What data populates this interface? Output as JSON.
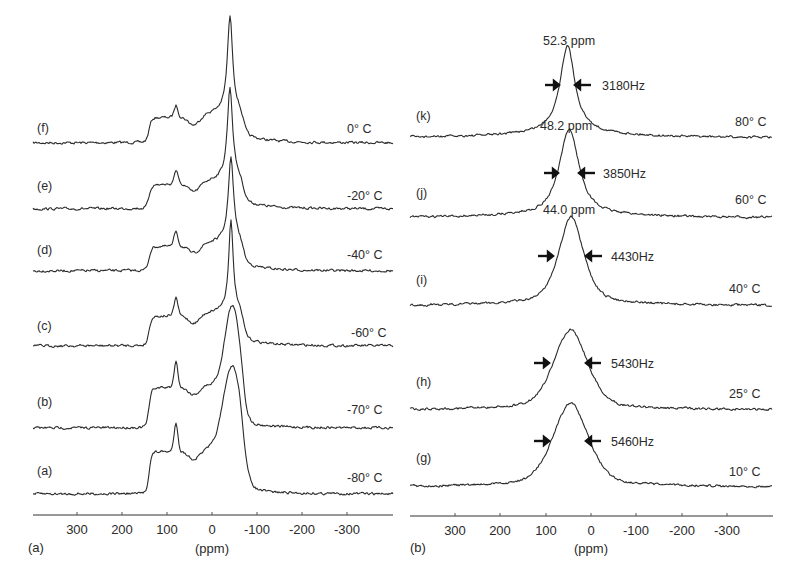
{
  "chart_data": [
    {
      "type": "line",
      "panel_label": "(a)",
      "title": "",
      "xlabel": "(ppm)",
      "ylabel": "",
      "x_reversed": true,
      "xlim": [
        400,
        -400
      ],
      "xticks": [
        300,
        200,
        100,
        0,
        -100,
        -200,
        -300
      ],
      "xtick_labels": [
        "300",
        "200",
        "100",
        "0",
        "-100",
        "-200",
        "-300"
      ],
      "grid": false,
      "legend": "none",
      "stacked_spectra": true,
      "series": [
        {
          "name": "(f)",
          "temperature": "0° C",
          "main_peak_ppm": -40,
          "shoulders_ppm": [
            140,
            80,
            20
          ]
        },
        {
          "name": "(e)",
          "temperature": "-20° C",
          "main_peak_ppm": -40,
          "shoulders_ppm": [
            140,
            80,
            20
          ]
        },
        {
          "name": "(d)",
          "temperature": "-40° C",
          "main_peak_ppm": -42,
          "shoulders_ppm": [
            140,
            80,
            20
          ]
        },
        {
          "name": "(c)",
          "temperature": "-60° C",
          "main_peak_ppm": -42,
          "shoulders_ppm": [
            140,
            80,
            20
          ]
        },
        {
          "name": "(b)",
          "temperature": "-70° C",
          "main_peak_ppm": -45,
          "shoulders_ppm": [
            140,
            80,
            20
          ]
        },
        {
          "name": "(a)",
          "temperature": "-80° C",
          "main_peak_ppm": -45,
          "shoulders_ppm": [
            140,
            80,
            20
          ]
        }
      ]
    },
    {
      "type": "line",
      "panel_label": "(b)",
      "title": "",
      "xlabel": "(ppm)",
      "ylabel": "",
      "x_reversed": true,
      "xlim": [
        400,
        -400
      ],
      "xticks": [
        300,
        200,
        100,
        0,
        -100,
        -200,
        -300
      ],
      "xtick_labels": [
        "300",
        "200",
        "100",
        "0",
        "-100",
        "-200",
        "-300"
      ],
      "grid": false,
      "legend": "none",
      "stacked_spectra": true,
      "series": [
        {
          "name": "(k)",
          "temperature": "80° C",
          "peak_label": "52.3 ppm",
          "peak_ppm": 52.3,
          "linewidth": "3180Hz"
        },
        {
          "name": "(j)",
          "temperature": "60° C",
          "peak_label": "48.2 ppm",
          "peak_ppm": 48.2,
          "linewidth": "3850Hz"
        },
        {
          "name": "(i)",
          "temperature": "40° C",
          "peak_label": "44.0 ppm",
          "peak_ppm": 44.0,
          "linewidth": "4430Hz"
        },
        {
          "name": "(h)",
          "temperature": "25° C",
          "peak_ppm": 45,
          "linewidth": "5430Hz"
        },
        {
          "name": "(g)",
          "temperature": "10° C",
          "peak_ppm": 45,
          "linewidth": "5460Hz"
        }
      ]
    }
  ],
  "panels": {
    "left": {
      "panel_label": "(a)",
      "axis_label": "(ppm)",
      "ticks": [
        "300",
        "200",
        "100",
        "0",
        "-100",
        "-200",
        "-300"
      ],
      "traces": [
        {
          "label": "(f)",
          "temp": "0° C"
        },
        {
          "label": "(e)",
          "temp": "-20° C"
        },
        {
          "label": "(d)",
          "temp": "-40° C"
        },
        {
          "label": "(c)",
          "temp": "-60° C"
        },
        {
          "label": "(b)",
          "temp": "-70° C"
        },
        {
          "label": "(a)",
          "temp": "-80° C"
        }
      ]
    },
    "right": {
      "panel_label": "(b)",
      "axis_label": "(ppm)",
      "ticks": [
        "300",
        "200",
        "100",
        "0",
        "-100",
        "-200",
        "-300"
      ],
      "traces": [
        {
          "label": "(k)",
          "temp": "80° C",
          "ppm": "52.3 ppm",
          "hz": "3180Hz"
        },
        {
          "label": "(j)",
          "temp": "60° C",
          "ppm": "48.2 ppm",
          "hz": "3850Hz"
        },
        {
          "label": "(i)",
          "temp": "40° C",
          "ppm": "44.0 ppm",
          "hz": "4430Hz"
        },
        {
          "label": "(h)",
          "temp": "25° C",
          "hz": "5430Hz"
        },
        {
          "label": "(g)",
          "temp": "10° C",
          "hz": "5460Hz"
        }
      ]
    }
  }
}
